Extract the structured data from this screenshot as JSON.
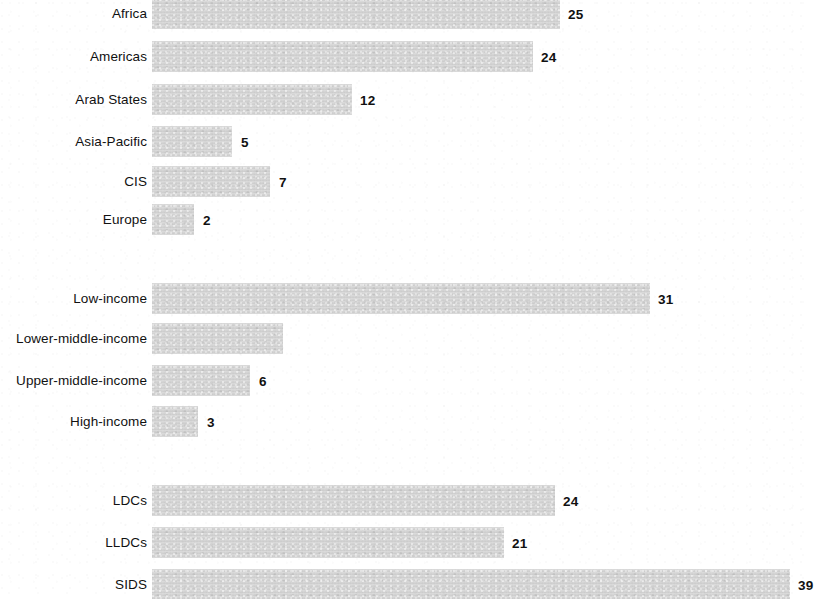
{
  "chart_data": {
    "type": "bar",
    "orientation": "horizontal",
    "title": "",
    "subtitle": "",
    "xlabel": "",
    "ylabel": "",
    "grid": false,
    "legend": null,
    "axis_visible": false,
    "bar_color": "#d2d2d2",
    "label_color": "#111111",
    "background": "#ffffff",
    "note": "Horizontal bar chart in three stacked groups separated by blank gaps; value labels sit to the right of each bar. The top bar is cropped at the top edge and the bottom bar is cropped at the bottom edge of the screenshot.",
    "groups": [
      {
        "name": "regions",
        "categories": [
          "Africa",
          "Americas",
          "Arab States",
          "Asia-Pacific",
          "CIS",
          "Europe"
        ],
        "values": [
          25,
          24,
          12,
          5,
          7,
          2
        ],
        "value_labels": [
          "25",
          "24",
          "12",
          "5",
          "7",
          "2"
        ]
      },
      {
        "name": "income-groups",
        "categories": [
          "Low-income",
          "Lower-middle-income",
          "Upper-middle-income",
          "High-income"
        ],
        "values": [
          31,
          null,
          6,
          3
        ],
        "value_labels": [
          "31",
          "",
          "6",
          "3"
        ]
      },
      {
        "name": "country-classifications",
        "categories": [
          "LDCs",
          "LLDCs",
          "SIDS"
        ],
        "values": [
          24,
          21,
          39
        ],
        "value_labels": [
          "24",
          "21",
          "39"
        ]
      }
    ],
    "categories": [
      "Africa",
      "Americas",
      "Arab States",
      "Asia-Pacific",
      "CIS",
      "Europe",
      "Low-income",
      "Lower-middle-income",
      "Upper-middle-income",
      "High-income",
      "LDCs",
      "LLDCs",
      "SIDS"
    ],
    "values": [
      25,
      24,
      12,
      5,
      7,
      2,
      31,
      null,
      6,
      3,
      24,
      21,
      39
    ]
  },
  "bars": [
    {
      "label": "Africa",
      "value_label": "25",
      "x": 152,
      "y": -2,
      "w": 408,
      "h": 31,
      "value_x": 568,
      "value_y": 8
    },
    {
      "label": "Americas",
      "value_label": "24",
      "x": 152,
      "y": 41,
      "w": 381,
      "h": 31,
      "value_x": 541,
      "value_y": 51
    },
    {
      "label": "Arab States",
      "value_label": "12",
      "x": 152,
      "y": 84,
      "w": 200,
      "h": 31,
      "value_x": 360,
      "value_y": 94
    },
    {
      "label": "Asia-Pacific",
      "value_label": "5",
      "x": 152,
      "y": 126,
      "w": 80,
      "h": 31,
      "value_x": 241,
      "value_y": 136
    },
    {
      "label": "CIS",
      "value_label": "7",
      "x": 152,
      "y": 166,
      "w": 118,
      "h": 31,
      "value_x": 279,
      "value_y": 176
    },
    {
      "label": "Europe",
      "value_label": "2",
      "x": 152,
      "y": 204,
      "w": 42,
      "h": 31,
      "value_x": 203,
      "value_y": 214
    },
    {
      "label": "Low-income",
      "value_label": "31",
      "x": 152,
      "y": 283,
      "w": 498,
      "h": 31,
      "value_x": 658,
      "value_y": 293
    },
    {
      "label": "Lower-middle-income",
      "value_label": "",
      "x": 152,
      "y": 323,
      "w": 131,
      "h": 31,
      "value_x": 291,
      "value_y": 333
    },
    {
      "label": "Upper-middle-income",
      "value_label": "6",
      "x": 152,
      "y": 365,
      "w": 98,
      "h": 31,
      "value_x": 259,
      "value_y": 375
    },
    {
      "label": "High-income",
      "value_label": "3",
      "x": 152,
      "y": 406,
      "w": 46,
      "h": 31,
      "value_x": 207,
      "value_y": 416
    },
    {
      "label": "LDCs",
      "value_label": "24",
      "x": 152,
      "y": 485,
      "w": 403,
      "h": 31,
      "value_x": 563,
      "value_y": 495
    },
    {
      "label": "LLDCs",
      "value_label": "21",
      "x": 152,
      "y": 527,
      "w": 352,
      "h": 31,
      "value_x": 512,
      "value_y": 537
    },
    {
      "label": "SIDS",
      "value_label": "39",
      "x": 152,
      "y": 569,
      "w": 638,
      "h": 31,
      "value_x": 798,
      "value_y": 579
    }
  ]
}
